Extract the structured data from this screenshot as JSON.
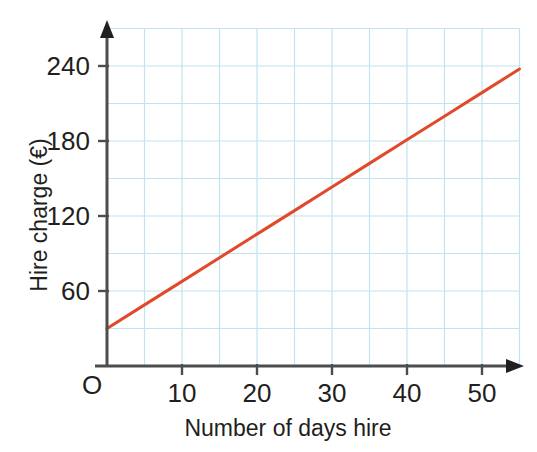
{
  "chart_data": {
    "type": "line",
    "title": "",
    "xlabel": "Number of days hire",
    "ylabel": "Hire charge (€)",
    "origin_label": "O",
    "xlim": [
      0,
      55
    ],
    "ylim": [
      0,
      270
    ],
    "xticks": [
      10,
      20,
      30,
      40,
      50
    ],
    "xtick_labels": [
      "10",
      "20",
      "30",
      "40",
      "50"
    ],
    "yticks": [
      60,
      120,
      180,
      240
    ],
    "ytick_labels": [
      "60",
      "120",
      "180",
      "240"
    ],
    "x_minor_step": 5,
    "y_minor_step": 30,
    "grid": true,
    "grid_color": "#bfe4f0",
    "axis_color": "#4d4d4d",
    "legend": "none",
    "series": [
      {
        "name": "Hire charge",
        "color": "#e04a2b",
        "x": [
          0,
          5,
          10,
          15,
          20,
          25,
          30,
          35,
          40,
          45,
          50,
          55
        ],
        "values": [
          30,
          48.9,
          67.7,
          86.6,
          105.5,
          124.3,
          143.2,
          162.1,
          181,
          199.8,
          218.7,
          237.6
        ],
        "intercept": 30,
        "slope": 3.775,
        "endpoints": [
          [
            0,
            30
          ],
          [
            55,
            237.6
          ]
        ]
      }
    ]
  },
  "axes": {
    "x_axis_name": "days-axis",
    "y_axis_name": "charge-axis"
  }
}
